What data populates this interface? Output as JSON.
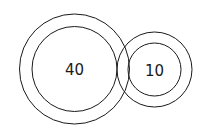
{
  "diagram": {
    "type": "concentric-circles",
    "stroke_color": "#1a1a1a",
    "background": "#ffffff",
    "groups": [
      {
        "label": "40",
        "center": [
          74.5,
          69
        ],
        "outer_radius": 55,
        "inner_radius": 42.5
      },
      {
        "label": "10",
        "center": [
          154.5,
          69.5
        ],
        "outer_radius": 37.5,
        "inner_radius": 26.5
      }
    ]
  }
}
